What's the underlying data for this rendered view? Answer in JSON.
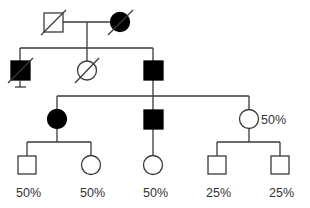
{
  "diagram": {
    "type": "pedigree",
    "colors": {
      "line": "#3a3a3a",
      "affected": "#000000",
      "unaffected": "#ffffff"
    },
    "generations": [
      {
        "index": 1,
        "individuals": [
          {
            "id": "I-1",
            "sex": "male",
            "affected": false,
            "deceased": true,
            "label": ""
          },
          {
            "id": "I-2",
            "sex": "female",
            "affected": true,
            "deceased": true,
            "label": ""
          }
        ]
      },
      {
        "index": 2,
        "individuals": [
          {
            "id": "II-1",
            "sex": "male",
            "affected": true,
            "deceased": true,
            "proband_marker": "stillbirth-bar",
            "label": ""
          },
          {
            "id": "II-2",
            "sex": "female",
            "affected": false,
            "deceased": true,
            "label": ""
          },
          {
            "id": "II-3",
            "sex": "male",
            "affected": true,
            "deceased": false,
            "label": ""
          }
        ]
      },
      {
        "index": 3,
        "individuals": [
          {
            "id": "III-1",
            "sex": "female",
            "affected": true,
            "deceased": false,
            "label": ""
          },
          {
            "id": "III-2",
            "sex": "male",
            "affected": true,
            "deceased": false,
            "label": ""
          },
          {
            "id": "III-3",
            "sex": "female",
            "affected": false,
            "deceased": false,
            "label": "50%"
          }
        ]
      },
      {
        "index": 4,
        "individuals": [
          {
            "id": "IV-1",
            "sex": "male",
            "affected": false,
            "deceased": false,
            "label": "50%"
          },
          {
            "id": "IV-2",
            "sex": "female",
            "affected": false,
            "deceased": false,
            "label": "50%"
          },
          {
            "id": "IV-3",
            "sex": "female",
            "affected": false,
            "deceased": false,
            "label": "50%"
          },
          {
            "id": "IV-4",
            "sex": "male",
            "affected": false,
            "deceased": false,
            "label": "25%"
          },
          {
            "id": "IV-5",
            "sex": "male",
            "affected": false,
            "deceased": false,
            "label": "25%"
          }
        ]
      }
    ],
    "labels": {
      "III_3": "50%",
      "IV_1": "50%",
      "IV_2": "50%",
      "IV_3": "50%",
      "IV_4": "25%",
      "IV_5": "25%"
    }
  }
}
